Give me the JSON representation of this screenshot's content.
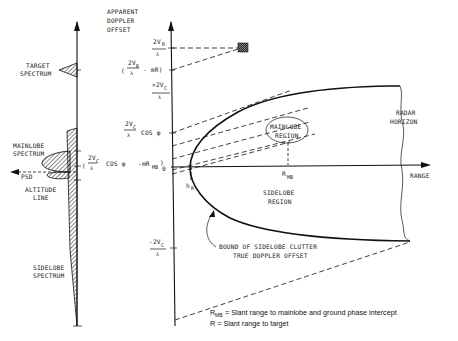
{
  "diagram": {
    "left_panel": {
      "psd_axis_label": "PSD",
      "target_spectrum": [
        "TARGET",
        "SPECTRUM"
      ],
      "mainlobe_spectrum": [
        "MAINLOBE",
        "SPECTRUM"
      ],
      "altitude_line": [
        "ALTITUDE",
        "LINE"
      ],
      "sidelobe_spectrum": [
        "SIDELOBE",
        "SPECTRUM"
      ]
    },
    "y_axis": {
      "title": [
        "APPARENT",
        "DOPPLER",
        "OFFSET"
      ],
      "ticks": {
        "two_vr_num": "2V",
        "two_vr_sub": "R",
        "two_vr_den": "λ",
        "target_open": "(",
        "target_num": "2V",
        "target_sub": "R",
        "target_den": "λ",
        "target_tail": "- mR)",
        "plus_two_vc_num": "+2V",
        "plus_two_vc_sub": "C",
        "plus_two_vc_den": "λ",
        "vc_cos_num": "2V",
        "vc_cos_sub": "C",
        "vc_cos_den": "λ",
        "vc_cos_tail": "COS φ",
        "mb_open": "(",
        "mb_num": "2V",
        "mb_sub": "C",
        "mb_den": "λ",
        "mb_mid": "COS φ",
        "mb_tail": "-mR",
        "mb_tail_sub": "MB",
        "mb_close": ")",
        "zero": "0",
        "minus_two_vc_num": "-2V",
        "minus_two_vc_sub": "C",
        "minus_two_vc_den": "λ"
      }
    },
    "x_axis": {
      "label": "RANGE",
      "h_r": "h",
      "h_r_sub": "R",
      "r_mb": "R",
      "r_mb_sub": "MB"
    },
    "regions": {
      "mainlobe_region": [
        "MAINLOBE",
        "REGION"
      ],
      "sidelobe_region": [
        "SIDELOBE",
        "REGION"
      ],
      "radar_horizon": [
        "RADAR",
        "HORIZON"
      ],
      "bound_note": [
        "BOUND OF SIDELOBE CLUTTER",
        "TRUE DOPPLER OFFSET"
      ]
    },
    "legend": {
      "rmb_symbol": "R",
      "rmb_sub": "MB",
      "rmb_text": "= Slant range to mainlobe and ground phase  intercept",
      "r_text": "R = Slant range to target"
    }
  }
}
